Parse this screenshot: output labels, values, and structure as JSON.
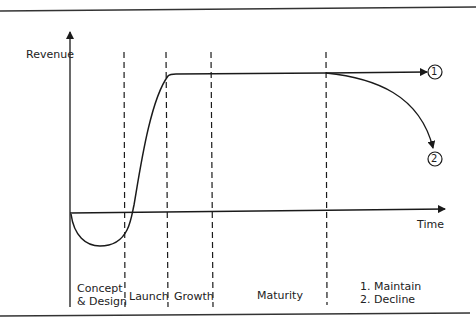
{
  "diagram": {
    "type": "product-life-cycle",
    "y_axis_label": "Revenue",
    "x_axis_label": "Time",
    "stages": [
      {
        "label_line1": "Concept",
        "label_line2": "& Design"
      },
      {
        "label_line1": "Launch"
      },
      {
        "label_line1": "Growth"
      },
      {
        "label_line1": "Maturity"
      },
      {
        "label_line1": "1. Maintain",
        "label_line2": "2. Decline"
      }
    ],
    "outcomes": [
      {
        "marker": "1",
        "meaning": "Maintain"
      },
      {
        "marker": "2",
        "meaning": "Decline"
      }
    ],
    "colors": {
      "line": "#1a1a1a",
      "background": "#ffffff"
    }
  }
}
